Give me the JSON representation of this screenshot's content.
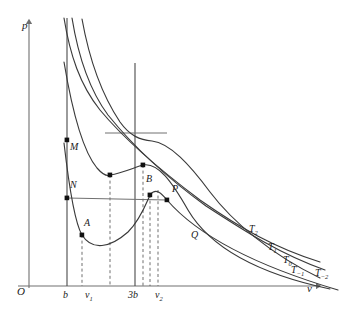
{
  "figure": {
    "background": "#ffffff",
    "curve_color": "#3a3a3a",
    "axis_color": "#707070",
    "dash_color": "#555555",
    "point_color": "#111111",
    "width": 345,
    "height": 317
  },
  "axes": {
    "y_axis_label": "p",
    "x_axis_label": "v",
    "origin_label": "O",
    "x_range": [
      0,
      345
    ],
    "y_range": [
      0,
      317
    ],
    "grid": false
  },
  "ticks": {
    "x": [
      {
        "label": "b",
        "sub": "",
        "x": 67
      },
      {
        "label": "v",
        "sub": "1",
        "x": 90
      },
      {
        "label": "3b",
        "sub": "",
        "x": 135
      },
      {
        "label": "v",
        "sub": "2",
        "x": 163
      }
    ]
  },
  "isotherm_labels": [
    {
      "text": "T",
      "sub": "2",
      "x": 249,
      "y": 230
    },
    {
      "text": "T",
      "sub": "1",
      "x": 268,
      "y": 248
    },
    {
      "text": "T",
      "sub": "0",
      "x": 283,
      "y": 261
    },
    {
      "text": "T",
      "sub": "−1",
      "x": 291,
      "y": 272
    },
    {
      "text": "T",
      "sub": "−2",
      "x": 315,
      "y": 274
    }
  ],
  "point_labels": [
    {
      "text": "M",
      "x": 70,
      "y": 148
    },
    {
      "text": "N",
      "x": 70,
      "y": 186
    },
    {
      "text": "A",
      "x": 84,
      "y": 224
    },
    {
      "text": "B",
      "x": 146,
      "y": 180
    },
    {
      "text": "P",
      "x": 172,
      "y": 190
    },
    {
      "text": "Q",
      "x": 191,
      "y": 236
    }
  ],
  "markers": [
    {
      "name": "marker-M",
      "x": 67,
      "y": 140
    },
    {
      "name": "marker-N",
      "x": 67,
      "y": 198
    },
    {
      "name": "marker-A",
      "x": 82,
      "y": 235
    },
    {
      "name": "marker-B",
      "x": 150,
      "y": 195
    },
    {
      "name": "marker-P",
      "x": 167,
      "y": 200
    },
    {
      "name": "marker-min-t1",
      "x": 110,
      "y": 175
    },
    {
      "name": "marker-max-t1",
      "x": 143,
      "y": 165
    }
  ],
  "chart_data": {
    "type": "line",
    "xlabel": "v",
    "ylabel": "p",
    "xlim": [
      0,
      345
    ],
    "ylim": [
      0,
      317
    ],
    "grid": false,
    "legend_position": "right",
    "series": [
      {
        "name": "T2",
        "label": "T₂",
        "description": "supercritical isotherm, monotonic decreasing",
        "path": "M 64,18 C 70,55 80,85 100,110 C 125,140 160,170 200,200 C 240,228 275,248 320,262"
      },
      {
        "name": "T1",
        "label": "T₁",
        "description": "supercritical isotherm, monotonic decreasing",
        "path": "M 72,18 C 78,55 88,88 108,115 C 133,146 166,177 206,206 C 246,232 280,254 325,270"
      },
      {
        "name": "T0",
        "label": "T₀",
        "description": "critical isotherm with inflection point at (3b, pc)",
        "path": "M 82,19 C 89,58 100,92 120,122 C 130,136 140,140 152,141 C 170,143 190,165 210,192 C 232,221 270,254 320,278"
      },
      {
        "name": "T-1",
        "label": "T₋₁",
        "description": "subcritical isotherm with local minimum and maximum",
        "path": "M 64,62 C 72,110 82,150 97,168 C 104,176 108,176 110,175 C 122,173 133,168 143,165 C 158,162 172,182 188,210 C 208,244 250,272 330,289"
      },
      {
        "name": "T-2",
        "label": "T₋₂",
        "description": "lowest subcritical isotherm through A, B, P with Maxwell construction",
        "path": "M 64,143 C 70,195 76,225 82,235 C 92,251 110,248 128,232 C 140,220 146,204 150,195 C 156,187 162,194 167,200 C 186,222 230,258 338,290"
      }
    ],
    "construction": {
      "maxwell_line": {
        "x1": 67,
        "y1": 198,
        "x2": 167,
        "y2": 200,
        "label": "N-P equal-area line"
      },
      "tangent_line": {
        "x1": 105,
        "y1": 133,
        "x2": 167,
        "y2": 133,
        "label": "critical tangent at inflection"
      },
      "vertical_b": {
        "x": 67,
        "y_top": 18,
        "y_bottom": 286,
        "style": "solid",
        "label": "v = b"
      },
      "vertical_3b": {
        "x": 135,
        "y_top": 63,
        "y_bottom": 286,
        "style": "solid",
        "label": "v = 3b"
      },
      "dashed_verticals": [
        {
          "x": 82,
          "y_top": 235,
          "y_bottom": 286,
          "label": "v1 through A"
        },
        {
          "x": 110,
          "y_top": 175,
          "y_bottom": 286,
          "label": "through T-1 minimum"
        },
        {
          "x": 143,
          "y_top": 165,
          "y_bottom": 286,
          "label": "through T-1 maximum"
        },
        {
          "x": 150,
          "y_top": 195,
          "y_bottom": 286,
          "label": "through B"
        },
        {
          "x": 158,
          "y_top": 190,
          "y_bottom": 286,
          "label": "v2"
        }
      ]
    }
  }
}
